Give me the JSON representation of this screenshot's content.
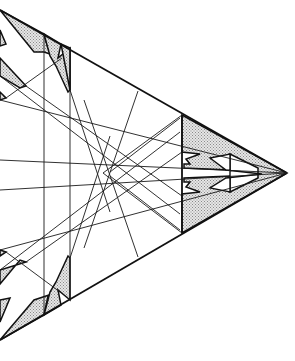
{
  "diagram": {
    "type": "crease-pattern",
    "colors": {
      "background": "#ffffff",
      "line": "#111111",
      "shade": "#c8c8c8"
    },
    "outline": {
      "top_edge": [
        [
          0,
          10
        ],
        [
          287,
          173
        ]
      ],
      "bottom_edge": [
        [
          0,
          340
        ],
        [
          287,
          173
        ]
      ],
      "tip": [
        287,
        173
      ]
    },
    "verticals": [
      44,
      70
    ],
    "center_point": [
      103,
      173
    ],
    "right_flap_boundary_x": 182
  }
}
